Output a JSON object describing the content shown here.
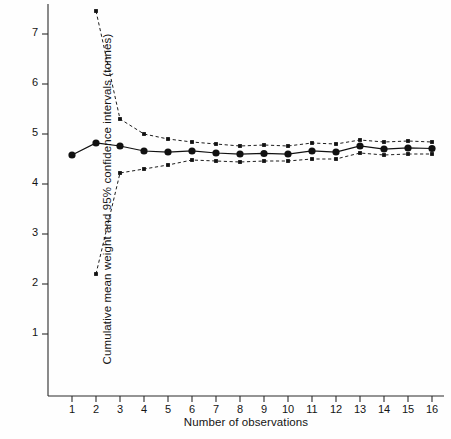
{
  "chart_data": {
    "type": "line",
    "title": "",
    "xlabel": "Number of observations",
    "ylabel": "Cumulative mean weight and 95% confidence intervals (tonnes)",
    "x": [
      1,
      2,
      3,
      4,
      5,
      6,
      7,
      8,
      9,
      10,
      11,
      12,
      13,
      14,
      15,
      16
    ],
    "xlim": [
      0.45,
      16.6
    ],
    "ylim": [
      0,
      7.65
    ],
    "xticks": [
      1,
      2,
      3,
      4,
      5,
      6,
      7,
      8,
      9,
      10,
      11,
      12,
      13,
      14,
      15,
      16
    ],
    "xticklabels": [
      "1",
      "2",
      "3",
      "4",
      "5",
      "6",
      "7",
      "8",
      "9",
      "10",
      "11",
      "12",
      "13",
      "14",
      "15",
      "16"
    ],
    "yticks": [
      1,
      2,
      3,
      4,
      5,
      6,
      7
    ],
    "yticklabels": [
      "1",
      "2",
      "3",
      "4",
      "5",
      "6",
      "7"
    ],
    "grid": false,
    "legend": false,
    "series": [
      {
        "name": "Cumulative mean weight",
        "style": "solid-with-markers",
        "color": "#111111",
        "values": [
          4.58,
          4.82,
          4.76,
          4.66,
          4.64,
          4.66,
          4.62,
          4.6,
          4.61,
          4.6,
          4.66,
          4.64,
          4.76,
          4.7,
          4.72,
          4.71
        ]
      },
      {
        "name": "Upper 95% confidence interval",
        "style": "dashed-with-markers",
        "color": "#111111",
        "values": [
          null,
          7.46,
          5.3,
          5.0,
          4.9,
          4.84,
          4.8,
          4.76,
          4.78,
          4.76,
          4.82,
          4.8,
          4.88,
          4.84,
          4.86,
          4.84
        ]
      },
      {
        "name": "Lower 95% confidence interval",
        "style": "dashed-with-markers",
        "color": "#111111",
        "values": [
          null,
          2.2,
          4.22,
          4.3,
          4.38,
          4.48,
          4.46,
          4.44,
          4.46,
          4.46,
          4.5,
          4.5,
          4.62,
          4.58,
          4.6,
          4.6
        ]
      }
    ]
  },
  "axes": {
    "y_axis_label": "Cumulative mean weight and 95% confidence intervals (tonnes)",
    "x_axis_label": "Number of observations"
  }
}
